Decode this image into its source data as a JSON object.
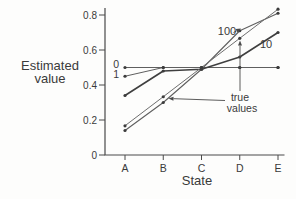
{
  "figure": {
    "background": "#fdfdfc",
    "colors": {
      "axis": "#4a4a4a",
      "text": "#3a3a3a",
      "line": "#5f5f5f",
      "line_emphasis": "#3f3f3f",
      "line_light": "#6e6e6e",
      "marker": "#3c3c3c",
      "arrow": "#4a4a4a"
    }
  },
  "chart_data": {
    "type": "line",
    "title": "",
    "xlabel": "State",
    "ylabel": "Estimated value",
    "ylabel_lines": [
      "Estimated",
      "value"
    ],
    "categories": [
      "A",
      "B",
      "C",
      "D",
      "E"
    ],
    "y_ticks": [
      0,
      0.2,
      0.4,
      0.6,
      0.8
    ],
    "y_tick_labels": [
      "0",
      "0.2",
      "0.4",
      "0.6",
      "0.8"
    ],
    "ylim": [
      0,
      0.84
    ],
    "grid": false,
    "legend_position": "inline-labels",
    "series": [
      {
        "name": "0",
        "values": [
          0.5,
          0.5,
          0.5,
          0.5,
          0.5
        ]
      },
      {
        "name": "1",
        "values": [
          0.45,
          0.5,
          0.5,
          0.5,
          0.5
        ]
      },
      {
        "name": "10",
        "values": [
          0.34,
          0.48,
          0.49,
          0.56,
          0.7
        ]
      },
      {
        "name": "100",
        "values": [
          0.14,
          0.3,
          0.49,
          0.71,
          0.81
        ]
      },
      {
        "name": "true values",
        "values": [
          0.167,
          0.333,
          0.5,
          0.667,
          0.833
        ]
      }
    ],
    "annotations": {
      "series_label_0": "0",
      "series_label_1": "1",
      "series_label_10": "10",
      "series_label_100": "100",
      "true_values_line1": "true",
      "true_values_line2": "values"
    }
  }
}
